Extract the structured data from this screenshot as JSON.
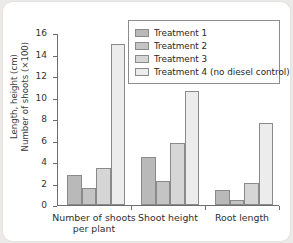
{
  "chart_data": {
    "type": "bar",
    "title": "",
    "xlabel": "",
    "ylabel": "Length, height (cm)\nNumber of shoots (×100)",
    "categories": [
      "Number of shoots\nper plant",
      "Shoot height",
      "Root length"
    ],
    "series": [
      {
        "name": "Treatment 1",
        "color": "#b9b9b9",
        "values": [
          2.8,
          4.5,
          1.4
        ]
      },
      {
        "name": "Treatment 2",
        "color": "#c4c4c4",
        "values": [
          1.65,
          2.3,
          0.5
        ]
      },
      {
        "name": "Treatment 3",
        "color": "#d6d6d6",
        "values": [
          3.5,
          5.8,
          2.1
        ]
      },
      {
        "name": "Treatment 4 (no diesel control)",
        "color": "#ececec",
        "values": [
          15.0,
          10.6,
          7.65
        ]
      }
    ],
    "ylim": [
      0,
      16
    ],
    "yticks": [
      0,
      2,
      4,
      6,
      8,
      10,
      12,
      14,
      16
    ],
    "ytick_labels": [
      "0",
      "2",
      "4",
      "6",
      "8",
      "10",
      "12",
      "14",
      "16"
    ],
    "grid": false,
    "legend_position": "top-right"
  },
  "legend": {
    "entries": [
      "Treatment 1",
      "Treatment 2",
      "Treatment 3",
      "Treatment 4 (no diesel control)"
    ]
  }
}
